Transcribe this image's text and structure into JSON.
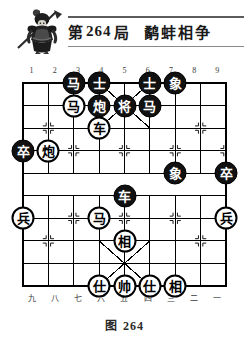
{
  "header": {
    "emblem_icon": "warrior-general-icon",
    "prefix": "第",
    "number": "264",
    "suffix": "局",
    "puzzle_name": "鹬蚌相争"
  },
  "board": {
    "files_top": [
      "1",
      "2",
      "3",
      "4",
      "5",
      "6",
      "7",
      "8",
      "9"
    ],
    "files_bottom": [
      "九",
      "八",
      "七",
      "六",
      "五",
      "四",
      "三",
      "二",
      "一"
    ],
    "columns": 9,
    "rows": 10,
    "line_color": "#000000",
    "background_color": "#ffffff",
    "pieces": [
      {
        "name": "black-horse",
        "label": "马",
        "side": "black",
        "file": 3,
        "rank": 0
      },
      {
        "name": "black-advisor",
        "label": "士",
        "side": "black",
        "file": 4,
        "rank": 0
      },
      {
        "name": "black-advisor",
        "label": "士",
        "side": "black",
        "file": 6,
        "rank": 0
      },
      {
        "name": "black-elephant",
        "label": "象",
        "side": "black",
        "file": 7,
        "rank": 0
      },
      {
        "name": "red-horse",
        "label": "马",
        "side": "red",
        "file": 3,
        "rank": 1
      },
      {
        "name": "black-cannon",
        "label": "炮",
        "side": "black",
        "file": 4,
        "rank": 1
      },
      {
        "name": "black-general",
        "label": "将",
        "side": "black",
        "file": 5,
        "rank": 1
      },
      {
        "name": "black-horse",
        "label": "马",
        "side": "black",
        "file": 6,
        "rank": 1
      },
      {
        "name": "red-chariot",
        "label": "车",
        "side": "red",
        "file": 4,
        "rank": 2
      },
      {
        "name": "black-pawn",
        "label": "卒",
        "side": "black",
        "file": 1,
        "rank": 3
      },
      {
        "name": "red-cannon",
        "label": "炮",
        "side": "red",
        "file": 2,
        "rank": 3
      },
      {
        "name": "black-elephant",
        "label": "象",
        "side": "black",
        "file": 7,
        "rank": 4
      },
      {
        "name": "black-pawn",
        "label": "卒",
        "side": "black",
        "file": 9,
        "rank": 4
      },
      {
        "name": "black-chariot",
        "label": "车",
        "side": "black",
        "file": 5,
        "rank": 5
      },
      {
        "name": "red-pawn",
        "label": "兵",
        "side": "red",
        "file": 1,
        "rank": 6
      },
      {
        "name": "red-horse",
        "label": "马",
        "side": "red",
        "file": 4,
        "rank": 6
      },
      {
        "name": "red-pawn",
        "label": "兵",
        "side": "red",
        "file": 9,
        "rank": 6
      },
      {
        "name": "red-minister",
        "label": "相",
        "side": "red",
        "file": 5,
        "rank": 7
      },
      {
        "name": "red-advisor",
        "label": "仕",
        "side": "red",
        "file": 4,
        "rank": 9
      },
      {
        "name": "red-general",
        "label": "帅",
        "side": "red",
        "file": 5,
        "rank": 9
      },
      {
        "name": "red-advisor",
        "label": "仕",
        "side": "red",
        "file": 6,
        "rank": 9
      },
      {
        "name": "red-minister",
        "label": "相",
        "side": "red",
        "file": 7,
        "rank": 9
      }
    ]
  },
  "caption": {
    "prefix": "图",
    "number": "264"
  }
}
